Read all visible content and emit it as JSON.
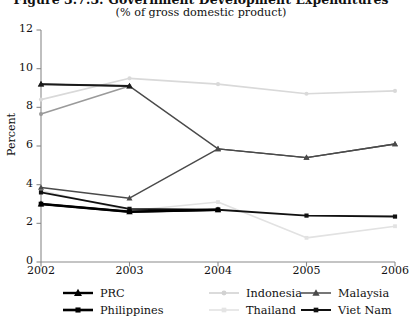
{
  "figure": {
    "title": "Figure 3.7.3: Government Development Expenditures",
    "subtitle": "(% of gross domestic product)"
  },
  "chart_data": {
    "type": "line",
    "title": "Figure 3.7.3: Government Development Expenditures",
    "subtitle": "(% of gross domestic product)",
    "xlabel": "",
    "ylabel": "Percent",
    "categories": [
      "2002",
      "2003",
      "2004",
      "2005",
      "2006"
    ],
    "x": [
      2002,
      2003,
      2004,
      2005,
      2006
    ],
    "ylim": [
      0,
      12
    ],
    "yticks": [
      0,
      2,
      4,
      6,
      8,
      10,
      12
    ],
    "grid": false,
    "legend_position": "bottom",
    "series": [
      {
        "name": "PRC",
        "color": "#000000",
        "marker": "triangle",
        "width": 2.2,
        "values": [
          3.0,
          2.6,
          2.7,
          null,
          null
        ]
      },
      {
        "name": "Indonesia",
        "color": "#d9d9d9",
        "marker": "circle",
        "width": 1.6,
        "values": [
          8.4,
          9.5,
          9.2,
          8.7,
          8.85
        ]
      },
      {
        "name": "Malaysia",
        "color": "#4a4a4a",
        "marker": "triangle",
        "width": 1.4,
        "values": [
          3.85,
          3.3,
          5.85,
          5.4,
          6.1
        ]
      },
      {
        "name": "Philippines",
        "color": "#000000",
        "marker": "square",
        "width": 2.6,
        "values": [
          3.0,
          2.6,
          2.7,
          null,
          null
        ]
      },
      {
        "name": "Thailand",
        "color": "#e2e2e2",
        "marker": "square",
        "width": 1.6,
        "values": [
          3.7,
          2.65,
          3.1,
          1.25,
          1.85
        ]
      },
      {
        "name": "Viet Nam",
        "color": "#111111",
        "marker": "square",
        "width": 1.9,
        "values": [
          3.6,
          2.75,
          2.7,
          2.4,
          2.35
        ]
      },
      {
        "name": "Malaysia upper",
        "color": "#4a4a4a",
        "marker": "triangle",
        "width": 1.4,
        "hidden_from_legend": true,
        "values": [
          9.2,
          9.1,
          5.85,
          5.4,
          6.1
        ]
      },
      {
        "name": "PRC upper",
        "color": "#1a1a1a",
        "marker": "triangle",
        "width": 2.0,
        "hidden_from_legend": true,
        "values": [
          9.2,
          9.1,
          null,
          null,
          null
        ]
      },
      {
        "name": "Indonesia lower",
        "color": "#9a9a9a",
        "marker": "circle",
        "width": 1.6,
        "hidden_from_legend": true,
        "values": [
          7.65,
          9.1,
          null,
          null,
          null
        ]
      }
    ],
    "axis_color": "#8a8a8a"
  },
  "axes": {
    "ylabel": "Percent",
    "ytick_labels": [
      "0",
      "2",
      "4",
      "6",
      "8",
      "10",
      "12"
    ],
    "xtick_labels": [
      "2002",
      "2003",
      "2004",
      "2005",
      "2006"
    ]
  },
  "legend": {
    "items": [
      {
        "label": "PRC",
        "marker": "triangle",
        "color": "#000000",
        "line_width": 2.4
      },
      {
        "label": "Indonesia",
        "marker": "circle",
        "color": "#d2d2d2",
        "line_width": 1.6
      },
      {
        "label": "Malaysia",
        "marker": "triangle",
        "color": "#4a4a4a",
        "line_width": 1.5
      },
      {
        "label": "Philippines",
        "marker": "square",
        "color": "#000000",
        "line_width": 2.6
      },
      {
        "label": "Thailand",
        "marker": "square",
        "color": "#e4e4e4",
        "line_width": 1.7
      },
      {
        "label": "Viet Nam",
        "marker": "square",
        "color": "#111111",
        "line_width": 2.0
      }
    ]
  }
}
